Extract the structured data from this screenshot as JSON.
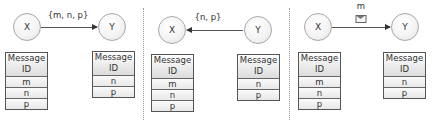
{
  "panels": [
    {
      "x_node": "X",
      "y_node": "Y",
      "direction": "X-to-Y",
      "edge_label": "{m, n, p}",
      "x_table": {
        "header": [
          "Message",
          "ID"
        ],
        "rows": [
          "m",
          "n",
          "p"
        ]
      },
      "y_table": {
        "header": [
          "Message",
          "ID"
        ],
        "rows": [
          "n",
          "p"
        ]
      }
    },
    {
      "x_node": "X",
      "y_node": "Y",
      "direction": "Y-to-X",
      "edge_label": "{n, p}",
      "x_table": {
        "header": [
          "Message",
          "ID"
        ],
        "rows": [
          "m",
          "n",
          "p"
        ]
      },
      "y_table": {
        "header": [
          "Message",
          "ID"
        ],
        "rows": [
          "n",
          "p"
        ]
      }
    },
    {
      "x_node": "X",
      "y_node": "Y",
      "direction": "X-to-Y",
      "edge_label": "m",
      "edge_icon": "envelope-icon",
      "x_table": {
        "header": [
          "Message",
          "ID"
        ],
        "rows": [
          "m",
          "n",
          "p"
        ]
      },
      "y_table": {
        "header": [
          "Message",
          "ID"
        ],
        "rows": [
          "n",
          "p"
        ]
      }
    }
  ],
  "colors": {
    "border": "#555555",
    "node_border": "#a8a8a8",
    "divider": "#9a9a9a"
  }
}
